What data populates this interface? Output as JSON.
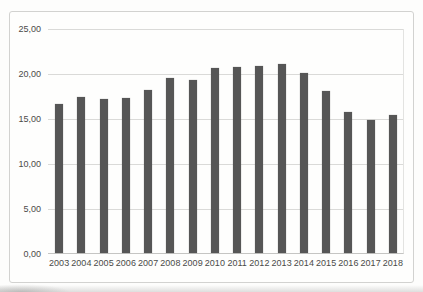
{
  "chart_data": {
    "type": "bar",
    "title": "",
    "xlabel": "",
    "ylabel": "",
    "categories": [
      "2003",
      "2004",
      "2005",
      "2006",
      "2007",
      "2008",
      "2009",
      "2010",
      "2011",
      "2012",
      "2013",
      "2014",
      "2015",
      "2016",
      "2017",
      "2018"
    ],
    "values": [
      16.6,
      17.3,
      17.1,
      17.2,
      18.1,
      19.5,
      19.2,
      20.6,
      20.7,
      20.8,
      21.0,
      20.0,
      18.0,
      15.7,
      14.8,
      15.3
    ],
    "ylim": [
      0,
      25
    ],
    "y_ticks": [
      0,
      5,
      10,
      15,
      20,
      25
    ],
    "y_tick_labels": [
      "0,00",
      "5,00",
      "10,00",
      "15,00",
      "20,00",
      "25,00"
    ],
    "decimal_separator": ",",
    "grid": true,
    "legend": false,
    "colors": {
      "bar": "#565656",
      "gridline": "#dadad8",
      "axis_line": "#c5c5c3",
      "tick_label": "#4a4a48",
      "chart_border": "#d2d2d0",
      "chart_background": "#fefefd",
      "page_background": "#fdfdfc"
    }
  }
}
